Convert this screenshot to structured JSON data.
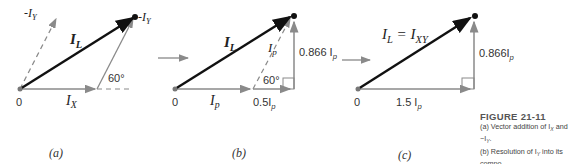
{
  "figure": {
    "title": "FIGURE 21-11",
    "caption_lines": [
      "(a) Vector addition of I",
      "X",
      " and −I",
      "Y",
      ". (b) Resolution of I",
      "Y",
      " into its components. (c) I",
      "L",
      " is the vector sum of the phase currents."
    ],
    "caption_a": "(a) Vector addition of I",
    "caption_a_sub1": "X",
    "caption_a_mid": " and −I",
    "caption_a_sub2": "Y",
    "caption_a_end": ".",
    "caption_b": "(b) Resolution of I",
    "caption_b_sub": "Y",
    "caption_b_end": " into its compo-",
    "caption_b2": "nents.",
    "caption_c": "  (c) I",
    "caption_c_sub": "L",
    "caption_c_end": " is the vector sum of the",
    "caption_c2": "phase currents."
  },
  "panels": {
    "a": {
      "label": "(a)",
      "origin": "0",
      "neg_iy_left": "-I",
      "neg_iy_left_sub": "Y",
      "neg_iy_tip": "-I",
      "neg_iy_tip_sub": "Y",
      "il": "I",
      "il_sub": "L",
      "ix": "I",
      "ix_sub": "X",
      "angle": "60°"
    },
    "b": {
      "label": "(b)",
      "origin": "0",
      "il": "I",
      "il_sub": "L",
      "ip_diag": "I",
      "ip_diag_sub": "p",
      "ip_base": "I",
      "ip_base_sub": "p",
      "half": "0.5I",
      "half_sub": "p",
      "vert": "0.866 I",
      "vert_sub": "p",
      "angle": "60°"
    },
    "c": {
      "label": "(c)",
      "origin": "0",
      "il_eq": "I",
      "il_eq_sub": "L",
      "eq": " = I",
      "ixy_sub": "XY",
      "base": "1.5 I",
      "base_sub": "p",
      "vert": "0.866I",
      "vert_sub": "p"
    }
  },
  "colors": {
    "resultant": "#111111",
    "component": "#8a8a8a"
  }
}
